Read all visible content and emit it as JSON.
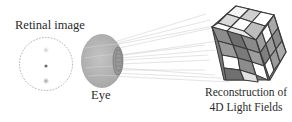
{
  "figure": {
    "labels": {
      "retinal_image": "Retinal image",
      "eye": "Eye",
      "reconstruction_line1": "Reconstruction of",
      "reconstruction_line2": "4D Light Fields"
    },
    "elements": [
      {
        "name": "retinal-image-circle",
        "style": "dashed",
        "spots": 3
      },
      {
        "name": "eye",
        "style": "grey sphere with lens"
      },
      {
        "name": "light-rays",
        "from": "eye",
        "to": "cube"
      },
      {
        "name": "rubiks-cube",
        "meaning": "4D light field reconstruction"
      }
    ],
    "colors": {
      "text": "#2a2a2a",
      "eye_fill": "#b5b5b5",
      "ray": "#bdbdbd",
      "cube_dark": "#555555"
    }
  }
}
